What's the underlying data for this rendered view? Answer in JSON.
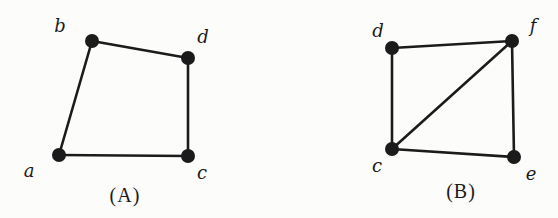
{
  "style": {
    "ink": "#1b1b1b",
    "background": "#fcfcfb",
    "vertex_radius": 7,
    "edge_width": 2.6
  },
  "figures": [
    {
      "key": "A",
      "caption": "(A)",
      "vertices": [
        {
          "id": "b",
          "label": "b",
          "x": 92,
          "y": 41,
          "label_x": 60,
          "label_y": 25
        },
        {
          "id": "d",
          "label": "d",
          "x": 188,
          "y": 58,
          "label_x": 203,
          "label_y": 36
        },
        {
          "id": "a",
          "label": "a",
          "x": 59,
          "y": 155,
          "label_x": 29,
          "label_y": 170
        },
        {
          "id": "c",
          "label": "c",
          "x": 188,
          "y": 156,
          "label_x": 202,
          "label_y": 172
        }
      ],
      "edges": [
        [
          "b",
          "d"
        ],
        [
          "b",
          "a"
        ],
        [
          "a",
          "c"
        ],
        [
          "d",
          "c"
        ]
      ]
    },
    {
      "key": "B",
      "caption": "(B)",
      "vertices": [
        {
          "id": "d",
          "label": "d",
          "x": 392,
          "y": 48,
          "label_x": 378,
          "label_y": 30
        },
        {
          "id": "f",
          "label": "f",
          "x": 512,
          "y": 41,
          "label_x": 533,
          "label_y": 25
        },
        {
          "id": "c",
          "label": "c",
          "x": 392,
          "y": 149,
          "label_x": 377,
          "label_y": 165
        },
        {
          "id": "e",
          "label": "e",
          "x": 514,
          "y": 157,
          "label_x": 531,
          "label_y": 173
        }
      ],
      "edges": [
        [
          "d",
          "f"
        ],
        [
          "d",
          "c"
        ],
        [
          "c",
          "f"
        ],
        [
          "f",
          "e"
        ],
        [
          "c",
          "e"
        ]
      ]
    }
  ]
}
